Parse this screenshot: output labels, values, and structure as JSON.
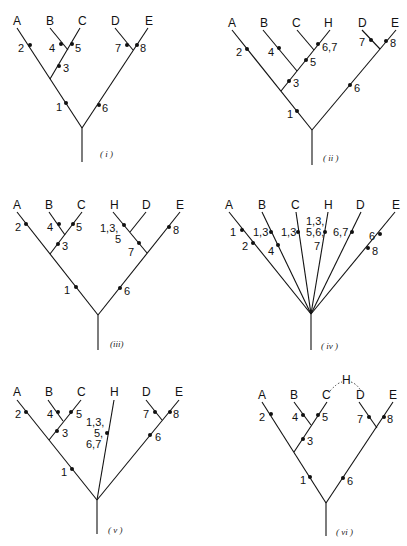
{
  "figure": {
    "panels": [
      {
        "id": "i",
        "caption": "( i )",
        "taxa": [
          "A",
          "B",
          "C",
          "D",
          "E"
        ],
        "marks": [
          "2",
          "4",
          "5",
          "3",
          "1",
          "7",
          "8",
          "6"
        ]
      },
      {
        "id": "ii",
        "caption": "( ii )",
        "taxa": [
          "A",
          "B",
          "C",
          "H",
          "D",
          "E"
        ],
        "marks": [
          "2",
          "4",
          "6,7",
          "5",
          "3",
          "1",
          "7",
          "8",
          "6"
        ]
      },
      {
        "id": "iii",
        "caption": "(iii)",
        "taxa": [
          "A",
          "B",
          "C",
          "H",
          "D",
          "E"
        ],
        "marks": [
          "2",
          "4",
          "5",
          "3",
          "1",
          "1,3,",
          "5",
          "7",
          "8",
          "6"
        ]
      },
      {
        "id": "iv",
        "caption": "( iv )",
        "taxa": [
          "A",
          "B",
          "C",
          "H",
          "D",
          "E"
        ],
        "marks": [
          "1",
          "2",
          "1,3",
          "4",
          "1,3",
          "1,3,",
          "5,6,",
          "7",
          "6,7",
          "6",
          "8"
        ]
      },
      {
        "id": "v",
        "caption": "( v )",
        "taxa": [
          "A",
          "B",
          "C",
          "H",
          "D",
          "E"
        ],
        "marks": [
          "2",
          "4",
          "5",
          "3",
          "1",
          "1,3,",
          "5,",
          "6,7",
          "7",
          "8",
          "6"
        ]
      },
      {
        "id": "vi",
        "caption": "( vi )",
        "taxa": [
          "A",
          "B",
          "C",
          "H",
          "D",
          "E"
        ],
        "marks": [
          "2",
          "4",
          "5",
          "3",
          "1",
          "7",
          "8",
          "6"
        ]
      }
    ]
  }
}
